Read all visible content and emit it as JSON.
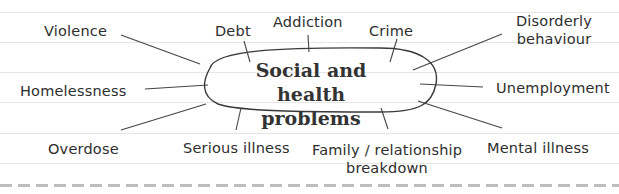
{
  "diagram": {
    "type": "mind-map",
    "center": {
      "line1": "Social and health",
      "line2": "problems"
    },
    "branches": [
      {
        "id": "violence",
        "label": "Violence"
      },
      {
        "id": "debt",
        "label": "Debt"
      },
      {
        "id": "addiction",
        "label": "Addiction"
      },
      {
        "id": "crime",
        "label": "Crime"
      },
      {
        "id": "disorderly",
        "label_line1": "Disorderly",
        "label_line2": "behaviour"
      },
      {
        "id": "homelessness",
        "label": "Homelessness"
      },
      {
        "id": "unemployment",
        "label": "Unemployment"
      },
      {
        "id": "overdose",
        "label": "Overdose"
      },
      {
        "id": "serious-illness",
        "label": "Serious illness"
      },
      {
        "id": "family",
        "label_line1": "Family / relationship",
        "label_line2": "breakdown"
      },
      {
        "id": "mental-illness",
        "label": "Mental illness"
      }
    ],
    "colors": {
      "text": "#2e2e2e",
      "lines": "#444444",
      "ruled": "#e6e6e6",
      "dashed": "#bdbdbd"
    }
  }
}
